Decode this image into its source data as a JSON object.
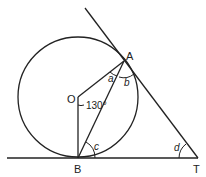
{
  "diagram": {
    "points": {
      "A": {
        "label": "A",
        "x": 124,
        "y": 61
      },
      "B": {
        "label": "B",
        "x": 78,
        "y": 158
      },
      "O": {
        "label": "O",
        "x": 78,
        "y": 97
      },
      "T": {
        "label": "T",
        "x": 197,
        "y": 158
      }
    },
    "angles": {
      "a": "a",
      "b": "b",
      "c": "c",
      "d": "d",
      "center_angle": "130°"
    },
    "stroke_color": "#222222"
  }
}
